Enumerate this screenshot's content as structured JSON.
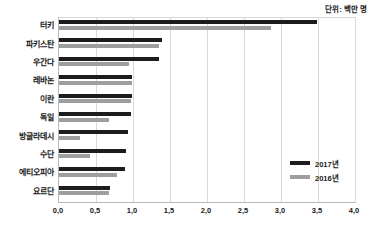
{
  "unit_note": "단위: 백만 명",
  "legend": {
    "position": "inside-center-right",
    "items": [
      {
        "label": "2017년",
        "color": "#1c1c1c"
      },
      {
        "label": "2016년",
        "color": "#9e9e9e"
      }
    ]
  },
  "chart_data": {
    "type": "bar",
    "orientation": "horizontal",
    "title": "",
    "subtitle": "",
    "xlabel": "",
    "ylabel": "",
    "unit": "단위: 백만 명",
    "xlim": [
      0,
      4
    ],
    "xticks": [
      0,
      0.5,
      1,
      1.5,
      2,
      2.5,
      3,
      3.5,
      4
    ],
    "xtick_labels": [
      "0,0",
      "0,5",
      "1,0",
      "1,5",
      "2,0",
      "2,5",
      "3,0",
      "3,5",
      "4,0"
    ],
    "grid": true,
    "grid_axis": "x",
    "categories": [
      "터키",
      "파키스탄",
      "우간다",
      "레바논",
      "이란",
      "독일",
      "방글라데시",
      "수단",
      "에티오피아",
      "요르단"
    ],
    "series": [
      {
        "name": "2017년",
        "color": "#1c1c1c",
        "values": [
          3.48,
          1.39,
          1.35,
          0.98,
          0.98,
          0.97,
          0.93,
          0.91,
          0.89,
          0.69
        ]
      },
      {
        "name": "2016년",
        "color": "#9e9e9e",
        "values": [
          2.87,
          1.35,
          0.94,
          0.98,
          0.97,
          0.67,
          0.28,
          0.42,
          0.79,
          0.68
        ]
      }
    ]
  }
}
